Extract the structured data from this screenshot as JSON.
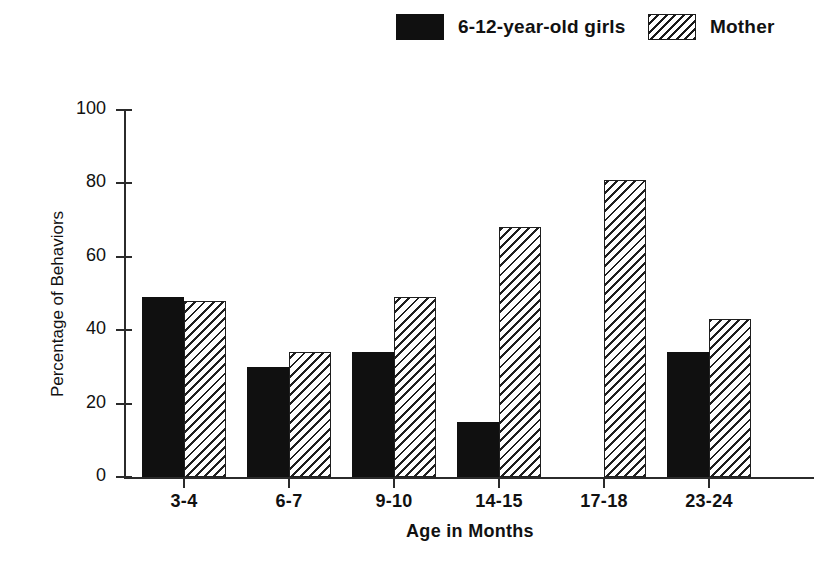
{
  "legend": {
    "entries": [
      {
        "label": "6-12-year-old girls",
        "swatch": "solid-black",
        "color": "#101010"
      },
      {
        "label": "Mother",
        "swatch": "diagonal-hatch",
        "color": "#1f1f1f"
      }
    ]
  },
  "chart_data": {
    "type": "bar",
    "title": "",
    "xlabel": "Age in Months",
    "ylabel": "Percentage of Behaviors",
    "categories": [
      "3-4",
      "6-7",
      "9-10",
      "14-15",
      "17-18",
      "23-24"
    ],
    "series": [
      {
        "name": "6-12-year-old girls",
        "values": [
          49,
          30,
          34,
          15,
          0,
          34
        ]
      },
      {
        "name": "Mother",
        "values": [
          48,
          34,
          49,
          68,
          81,
          43
        ]
      }
    ],
    "ylim": [
      0,
      100
    ],
    "yticks": [
      0,
      20,
      40,
      60,
      80,
      100
    ],
    "ytick_labels": [
      "0",
      "20",
      "40",
      "60",
      "80",
      "100"
    ],
    "grid": false,
    "legend_position": "top"
  }
}
